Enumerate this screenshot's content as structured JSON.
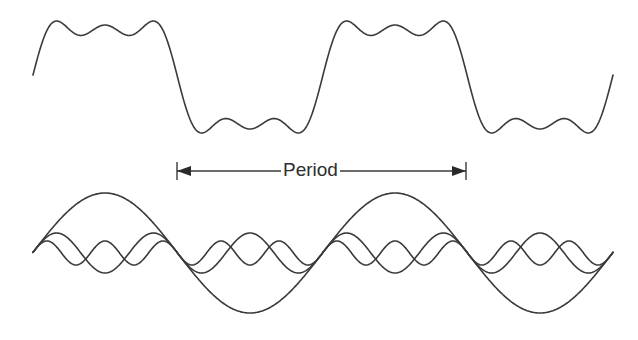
{
  "diagram": {
    "period_label": "Period",
    "stroke_color": "#3a3a3a",
    "background": "#ffffff"
  },
  "chart_data": {
    "type": "line",
    "period_px": 290,
    "x_start": 33,
    "x_end": 613,
    "phase_zero_x": 32.5,
    "composite": {
      "name": "Composite waveform (sin t + sin 3t/3 + sin 5t/5)",
      "center_y": 77,
      "amplitude": 60,
      "harmonics": [
        1,
        3,
        5
      ]
    },
    "components": {
      "center_y": 253,
      "series": [
        {
          "name": "Fundamental",
          "harmonic": 1,
          "amplitude": 60
        },
        {
          "name": "3rd harmonic",
          "harmonic": 3,
          "amplitude": 20
        },
        {
          "name": "5th harmonic",
          "harmonic": 5,
          "amplitude": 12
        }
      ]
    },
    "period_marker": {
      "x1": 177,
      "x2": 466,
      "y": 171,
      "label": "Period"
    },
    "axes": "none",
    "grid": false,
    "legend": "none"
  }
}
